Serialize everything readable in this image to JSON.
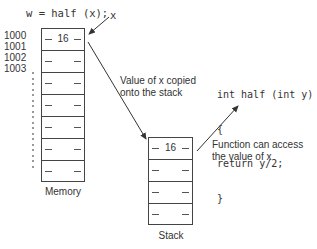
{
  "call": {
    "code": "w = half (x);",
    "pointer_label": "x"
  },
  "memory": {
    "label": "Memory",
    "addresses": [
      "1000",
      "1001",
      "1002",
      "1003"
    ],
    "cells": [
      "16",
      "",
      "",
      "",
      "",
      "",
      ""
    ]
  },
  "copy_note": {
    "line1": "Value of x copied",
    "line2": "onto the stack"
  },
  "stack": {
    "label": "Stack",
    "cells": [
      "16",
      "",
      "",
      ""
    ]
  },
  "function_code": {
    "lines": [
      "int half (int y)",
      "{",
      "return y/2;",
      "}"
    ]
  },
  "access_note": {
    "line1": "Function can access",
    "line2": "the value of x"
  },
  "colors": {
    "line": "#444444",
    "text": "#333333",
    "background": "#ffffff"
  }
}
